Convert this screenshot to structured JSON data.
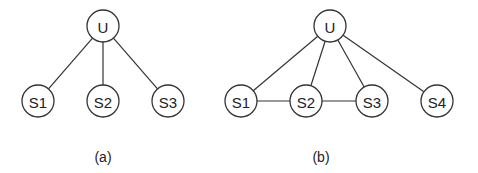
{
  "diagrams": [
    {
      "caption": "(a)",
      "caption_pos": [
        103,
        157
      ],
      "node_radius": 16,
      "nodes": [
        {
          "id": "U",
          "label": "U",
          "x": 103,
          "y": 26
        },
        {
          "id": "S1",
          "label": "S1",
          "x": 38,
          "y": 101
        },
        {
          "id": "S2",
          "label": "S2",
          "x": 103,
          "y": 101
        },
        {
          "id": "S3",
          "label": "S3",
          "x": 168,
          "y": 101
        }
      ],
      "edges": [
        [
          "U",
          "S1"
        ],
        [
          "U",
          "S2"
        ],
        [
          "U",
          "S3"
        ]
      ]
    },
    {
      "caption": "(b)",
      "caption_pos": [
        321,
        157
      ],
      "node_radius": 16,
      "nodes": [
        {
          "id": "U",
          "label": "U",
          "x": 330,
          "y": 26
        },
        {
          "id": "S1",
          "label": "S1",
          "x": 241,
          "y": 101
        },
        {
          "id": "S2",
          "label": "S2",
          "x": 306,
          "y": 101
        },
        {
          "id": "S3",
          "label": "S3",
          "x": 372,
          "y": 101
        },
        {
          "id": "S4",
          "label": "S4",
          "x": 437,
          "y": 101
        }
      ],
      "edges": [
        [
          "U",
          "S1"
        ],
        [
          "U",
          "S2"
        ],
        [
          "U",
          "S3"
        ],
        [
          "U",
          "S4"
        ],
        [
          "S1",
          "S2"
        ],
        [
          "S2",
          "S3"
        ]
      ]
    }
  ],
  "colors": {
    "stroke": "#333333",
    "text": "#222222",
    "background": "#ffffff"
  }
}
